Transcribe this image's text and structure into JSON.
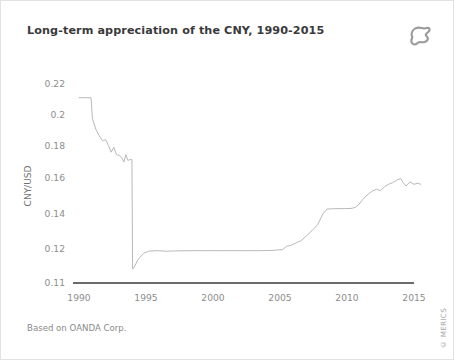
{
  "card": {
    "title": "Long-term appreciation of the CNY, 1990-2015",
    "source_note": "Based on OANDA Corp.",
    "copyright": "© MERICS",
    "logo_icon": "merics-blob-logo-icon",
    "background_color": "#ffffff",
    "border_color": "#e2e2e2",
    "title_color": "#3a3a3a",
    "note_color": "#8a8a8a"
  },
  "chart_data": {
    "type": "line",
    "title": "Long-term appreciation of the CNY, 1990-2015",
    "xlabel": "",
    "ylabel": "CNY/USD",
    "xlim": [
      1990,
      2015.6
    ],
    "ylim": [
      0.11,
      0.225
    ],
    "xticks": [
      1990,
      1995,
      2000,
      2005,
      2010,
      2015
    ],
    "xtick_labels": [
      "1990",
      "1995",
      "2000",
      "2005",
      "2010",
      "2015"
    ],
    "yticks": [
      0.11,
      0.12,
      0.14,
      0.16,
      0.18,
      0.2,
      0.22
    ],
    "ytick_labels": [
      "0.11",
      "0.12",
      "0.14",
      "0.16",
      "0.18",
      "0.2",
      "0.22"
    ],
    "grid": false,
    "axis_note": "y-axis is broken between 0.11 and 0.12; 0.11 sits on the dark baseline rule",
    "baseline_value": 0.11,
    "baseline_color": "#3a3a3a",
    "line_color": "#b9b9b9",
    "line_width": 1,
    "series": [
      {
        "name": "CNY/USD",
        "x": [
          1990.0,
          1990.5,
          1990.9,
          1991.0,
          1991.25,
          1991.5,
          1991.75,
          1992.0,
          1992.2,
          1992.4,
          1992.6,
          1992.8,
          1993.0,
          1993.2,
          1993.35,
          1993.5,
          1993.65,
          1993.8,
          1993.95,
          1994.0,
          1994.1,
          1994.4,
          1994.8,
          1995.2,
          1995.8,
          1996.5,
          1997.5,
          1998.5,
          1999.5,
          2000.5,
          2001.5,
          2002.5,
          2003.5,
          2004.5,
          2005.2,
          2005.5,
          2005.8,
          2006.2,
          2006.6,
          2007.0,
          2007.4,
          2007.8,
          2008.2,
          2008.5,
          2008.9,
          2009.4,
          2009.9,
          2010.3,
          2010.6,
          2010.9,
          2011.2,
          2011.5,
          2011.9,
          2012.2,
          2012.5,
          2012.8,
          2013.1,
          2013.4,
          2013.7,
          2014.0,
          2014.2,
          2014.4,
          2014.7,
          2015.0,
          2015.3,
          2015.5
        ],
        "y": [
          0.2135,
          0.2135,
          0.2135,
          0.201,
          0.1945,
          0.1905,
          0.1875,
          0.188,
          0.1845,
          0.1805,
          0.1835,
          0.179,
          0.1785,
          0.177,
          0.1745,
          0.179,
          0.1755,
          0.176,
          0.176,
          0.1145,
          0.115,
          0.1175,
          0.1195,
          0.1205,
          0.1208,
          0.1205,
          0.1207,
          0.1208,
          0.1208,
          0.1208,
          0.1208,
          0.1208,
          0.1208,
          0.121,
          0.1215,
          0.1235,
          0.124,
          0.1255,
          0.127,
          0.13,
          0.133,
          0.1365,
          0.143,
          0.146,
          0.1462,
          0.1463,
          0.1463,
          0.1464,
          0.147,
          0.149,
          0.152,
          0.1545,
          0.157,
          0.158,
          0.1572,
          0.1595,
          0.161,
          0.162,
          0.1635,
          0.1645,
          0.162,
          0.16,
          0.1625,
          0.161,
          0.1618,
          0.161
        ]
      }
    ]
  }
}
